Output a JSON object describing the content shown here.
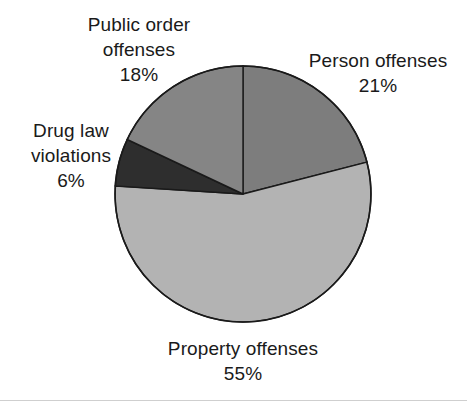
{
  "chart_data": {
    "type": "pie",
    "title": "",
    "subtitle": "",
    "xlabel": "",
    "ylabel": "",
    "legend_position": "none",
    "grid": false,
    "labels_inline": true,
    "start_angle_deg": 0,
    "direction": "clockwise",
    "categories": [
      "Person offenses",
      "Property offenses",
      "Drug law violations",
      "Public order offenses"
    ],
    "values": [
      21,
      55,
      6,
      18
    ],
    "value_unit": "%",
    "slices": [
      {
        "label": "Person offenses",
        "value": 21,
        "display_value": "21%",
        "color": "#7d7d7d",
        "start_deg": 0,
        "end_deg": 75.6
      },
      {
        "label": "Property offenses",
        "value": 55,
        "display_value": "55%",
        "color": "#b3b3b3",
        "start_deg": 75.6,
        "end_deg": 273.6
      },
      {
        "label": "Drug law violations",
        "value": 6,
        "display_value": "6%",
        "color": "#2e2e2e",
        "start_deg": 273.6,
        "end_deg": 295.2
      },
      {
        "label": "Public order offenses",
        "value": 18,
        "display_value": "18%",
        "color": "#858585",
        "start_deg": 295.2,
        "end_deg": 360
      }
    ]
  },
  "labels": {
    "public_order": {
      "name_line1": "Public order",
      "name_line2": "offenses",
      "value": "18%"
    },
    "person": {
      "name_line1": "Person offenses",
      "value": "21%"
    },
    "drug_law": {
      "name_line1": "Drug law",
      "name_line2": "violations",
      "value": "6%"
    },
    "property": {
      "name_line1": "Property offenses",
      "value": "55%"
    }
  },
  "style": {
    "background": "#ffffff",
    "outline": "#1a1a1a",
    "text": "#1a1a1a",
    "rule": "#cfcfcf"
  }
}
